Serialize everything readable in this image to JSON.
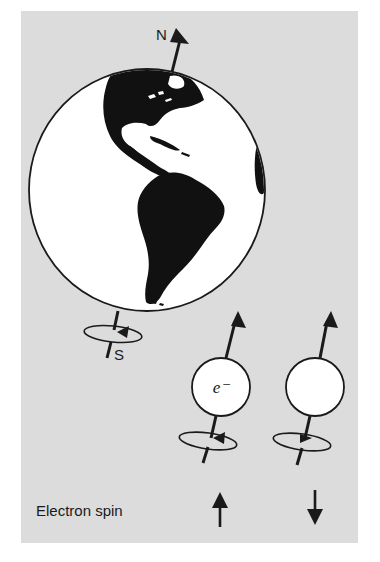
{
  "figure": {
    "labels": {
      "north": "N",
      "south": "S",
      "electron": "e⁻",
      "caption": "Electron spin"
    },
    "icons": {
      "spin_up": "arrow-up-icon",
      "spin_down": "arrow-down-icon"
    },
    "colors": {
      "background": "#ffffff",
      "panel": "#dcdcdc",
      "ink": "#1a1a1a",
      "globe_fill": "#ffffff",
      "land": "#111111"
    },
    "elements": [
      {
        "name": "earth-globe",
        "description": "Earth showing the Americas, tilted axis with N arrow and S pole, rotation ellipse near S"
      },
      {
        "name": "electron-spin-up",
        "description": "Electron sphere labeled e⁻ with upward axis arrow, counter-clockwise rotation"
      },
      {
        "name": "electron-spin-down",
        "description": "Electron sphere with upward axis arrow, clockwise rotation"
      }
    ]
  }
}
